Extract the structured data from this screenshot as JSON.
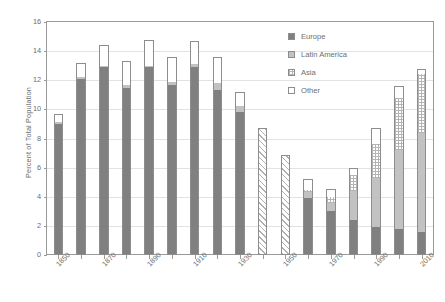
{
  "chart_data": {
    "type": "bar",
    "stacked": true,
    "title": "",
    "xlabel": "",
    "ylabel": "Percent of Total Population",
    "ylim": [
      0,
      16
    ],
    "ytick_labels": [
      "0",
      "2",
      "4",
      "6",
      "8",
      "10",
      "12",
      "14",
      "16"
    ],
    "ytick_values": [
      0,
      2,
      4,
      6,
      8,
      10,
      12,
      14,
      16
    ],
    "grid": true,
    "legend_position": "upper right",
    "categories": [
      "1850",
      "1860",
      "1870",
      "1880",
      "1890",
      "1900",
      "1910",
      "1920",
      "1930",
      "1940",
      "1950",
      "1960",
      "1970",
      "1980",
      "1990",
      "2000",
      "2010"
    ],
    "xtick_labels_shown": [
      "1850",
      "1870",
      "1890",
      "1910",
      "1930",
      "1950",
      "1970",
      "1990",
      "2010"
    ],
    "series": [
      {
        "name": "Europe",
        "color": "#808080",
        "pattern": "solid",
        "values": [
          9.0,
          12.1,
          12.9,
          11.5,
          12.9,
          11.7,
          12.9,
          11.3,
          9.8,
          0.0,
          0.0,
          3.9,
          3.0,
          2.4,
          1.9,
          1.8,
          1.6
        ]
      },
      {
        "name": "Latin America",
        "color": "#c2c2c2",
        "pattern": "solid",
        "values": [
          0.1,
          0.1,
          0.1,
          0.2,
          0.1,
          0.2,
          0.2,
          0.5,
          0.4,
          0.0,
          0.0,
          0.4,
          0.6,
          2.0,
          3.4,
          5.4,
          6.8
        ]
      },
      {
        "name": "Asia",
        "color": "#ffffff",
        "pattern": "cross-hatch",
        "values": [
          0.0,
          0.0,
          0.0,
          0.0,
          0.0,
          0.0,
          0.0,
          0.0,
          0.0,
          8.7,
          6.9,
          0.2,
          0.4,
          1.1,
          2.3,
          3.6,
          4.0
        ]
      },
      {
        "name": "Other",
        "color": "#ffffff",
        "pattern": "solid",
        "values": [
          0.6,
          1.0,
          1.4,
          1.6,
          1.8,
          1.7,
          1.6,
          1.8,
          1.0,
          0.0,
          0.0,
          0.7,
          0.5,
          0.5,
          1.1,
          0.8,
          0.4
        ]
      }
    ],
    "totals": [
      9.7,
      13.2,
      14.4,
      13.3,
      14.8,
      13.6,
      14.7,
      13.6,
      11.2,
      8.7,
      6.9,
      5.2,
      4.5,
      6.0,
      8.7,
      11.6,
      12.8
    ]
  },
  "legend": {
    "items": [
      {
        "label": "Europe",
        "swatch": "solid-dark-gray"
      },
      {
        "label": "Latin America",
        "swatch": "solid-light-gray"
      },
      {
        "label": "Asia",
        "swatch": "cross-hatch"
      },
      {
        "label": "Other",
        "swatch": "white"
      }
    ]
  }
}
